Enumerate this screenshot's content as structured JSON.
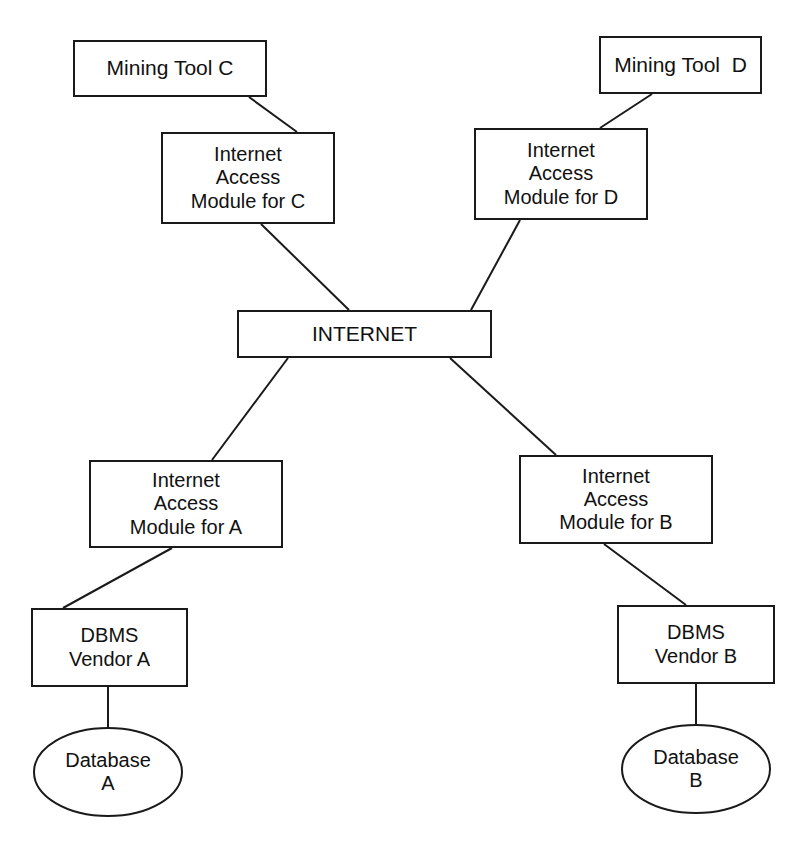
{
  "diagram": {
    "type": "node-link-diagram",
    "canvas": {
      "width": 809,
      "height": 845
    },
    "style": {
      "background": "#ffffff",
      "stroke": "#1a1a1a",
      "text_color": "#111111",
      "line_width": 2
    },
    "nodes": [
      {
        "id": "mining-tool-c",
        "shape": "rectangle",
        "lines": [
          "Mining Tool C"
        ],
        "font_size": 21,
        "x": 73,
        "y": 40,
        "w": 194,
        "h": 57
      },
      {
        "id": "mining-tool-d",
        "shape": "rectangle",
        "lines": [
          "Mining Tool  D"
        ],
        "font_size": 21,
        "x": 599,
        "y": 36,
        "w": 163,
        "h": 58
      },
      {
        "id": "internet-access-module-c",
        "shape": "rectangle",
        "lines": [
          "Internet",
          "Access",
          "Module for C"
        ],
        "font_size": 20,
        "x": 161,
        "y": 132,
        "w": 174,
        "h": 92
      },
      {
        "id": "internet-access-module-d",
        "shape": "rectangle",
        "lines": [
          "Internet",
          "Access",
          "Module for D"
        ],
        "font_size": 20,
        "x": 474,
        "y": 128,
        "w": 174,
        "h": 92
      },
      {
        "id": "internet",
        "shape": "rectangle",
        "lines": [
          "INTERNET"
        ],
        "font_size": 21,
        "x": 237,
        "y": 310,
        "w": 255,
        "h": 48
      },
      {
        "id": "internet-access-module-a",
        "shape": "rectangle",
        "lines": [
          "Internet",
          "Access",
          "Module for A"
        ],
        "font_size": 20,
        "x": 89,
        "y": 460,
        "w": 194,
        "h": 88
      },
      {
        "id": "internet-access-module-b",
        "shape": "rectangle",
        "lines": [
          "Internet",
          "Access",
          "Module for B"
        ],
        "font_size": 20,
        "x": 519,
        "y": 455,
        "w": 194,
        "h": 89
      },
      {
        "id": "dbms-vendor-a",
        "shape": "rectangle",
        "lines": [
          "DBMS",
          "Vendor A"
        ],
        "font_size": 20,
        "x": 31,
        "y": 608,
        "w": 157,
        "h": 79
      },
      {
        "id": "dbms-vendor-b",
        "shape": "rectangle",
        "lines": [
          "DBMS",
          "Vendor B"
        ],
        "font_size": 20,
        "x": 617,
        "y": 605,
        "w": 158,
        "h": 79
      },
      {
        "id": "database-a",
        "shape": "ellipse",
        "lines": [
          "Database",
          "A"
        ],
        "font_size": 20,
        "cx": 108,
        "cy": 772,
        "rx": 74,
        "ry": 44
      },
      {
        "id": "database-b",
        "shape": "ellipse",
        "lines": [
          "Database",
          "B"
        ],
        "font_size": 20,
        "cx": 696,
        "cy": 769,
        "rx": 74,
        "ry": 44
      }
    ],
    "edges": [
      {
        "id": "edge-mining-c-to-iam-c",
        "from": "mining-tool-c",
        "to": "internet-access-module-c",
        "x1": 249,
        "y1": 97,
        "x2": 297,
        "y2": 132
      },
      {
        "id": "edge-mining-d-to-iam-d",
        "from": "mining-tool-d",
        "to": "internet-access-module-d",
        "x1": 652,
        "y1": 94,
        "x2": 600,
        "y2": 128
      },
      {
        "id": "edge-iam-c-to-internet",
        "from": "internet-access-module-c",
        "to": "internet",
        "x1": 261,
        "y1": 224,
        "x2": 349,
        "y2": 310
      },
      {
        "id": "edge-iam-d-to-internet",
        "from": "internet-access-module-d",
        "to": "internet",
        "x1": 520,
        "y1": 220,
        "x2": 471,
        "y2": 310
      },
      {
        "id": "edge-internet-to-iam-a",
        "from": "internet",
        "to": "internet-access-module-a",
        "x1": 288,
        "y1": 358,
        "x2": 212,
        "y2": 460
      },
      {
        "id": "edge-internet-to-iam-b",
        "from": "internet",
        "to": "internet-access-module-b",
        "x1": 450,
        "y1": 358,
        "x2": 556,
        "y2": 455
      },
      {
        "id": "edge-iam-a-to-dbms-a",
        "from": "internet-access-module-a",
        "to": "dbms-vendor-a",
        "x1": 172,
        "y1": 548,
        "x2": 63,
        "y2": 608
      },
      {
        "id": "edge-iam-b-to-dbms-b",
        "from": "internet-access-module-b",
        "to": "dbms-vendor-b",
        "x1": 604,
        "y1": 544,
        "x2": 686,
        "y2": 605
      },
      {
        "id": "edge-dbms-a-to-database-a",
        "from": "dbms-vendor-a",
        "to": "database-a",
        "x1": 108,
        "y1": 687,
        "x2": 108,
        "y2": 729
      },
      {
        "id": "edge-dbms-b-to-database-b",
        "from": "dbms-vendor-b",
        "to": "database-b",
        "x1": 696,
        "y1": 684,
        "x2": 696,
        "y2": 726
      }
    ]
  }
}
